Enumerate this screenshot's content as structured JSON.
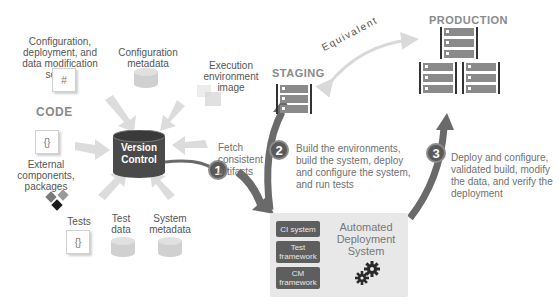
{
  "code_section": {
    "heading": "CODE",
    "scripts_label": "Configuration, deployment, and data modification scripts",
    "scripts_icon": "#",
    "config_metadata_label": "Configuration metadata",
    "exec_env_label": "Execution environment image",
    "external_label": "External components, packages",
    "external_icon": "{}",
    "tests_label": "Tests",
    "tests_icon": "{}",
    "test_data_label": "Test data",
    "system_metadata_label": "System metadata"
  },
  "version_control": {
    "line1": "Version",
    "line2": "Control"
  },
  "steps": [
    {
      "number": "1",
      "text": "Fetch consistent artifacts"
    },
    {
      "number": "2",
      "text": "Build the environments, build the system, deploy and configure the system, and run tests"
    },
    {
      "number": "3",
      "text": "Deploy and configure, validated build, modify the data, and verify the deployment"
    }
  ],
  "environments": {
    "staging": "STAGING",
    "production": "PRODUCTION",
    "equivalent": "Equivalent"
  },
  "automated_system": {
    "title": "Automated Deployment System",
    "components": [
      "CI system",
      "Test framework",
      "CM framework"
    ]
  },
  "colors": {
    "dark": "#4a4a4a",
    "arrow_dark": "#666666",
    "arrow_light": "#d8d8d8",
    "panel": "#e8e8e8"
  }
}
